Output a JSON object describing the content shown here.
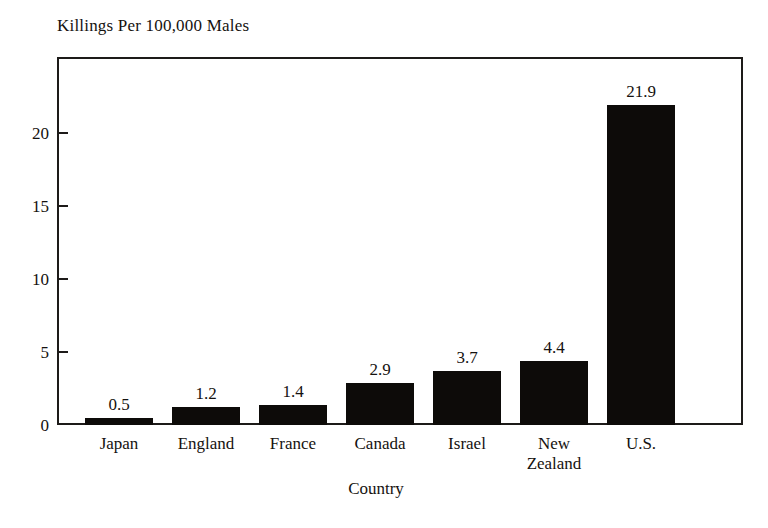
{
  "chart_data": {
    "type": "bar",
    "title": "Killings Per 100,000 Males",
    "xlabel": "Country",
    "ylabel": "",
    "categories": [
      "Japan",
      "England",
      "France",
      "Canada",
      "Israel",
      "New Zealand",
      "U.S."
    ],
    "category_lines": [
      [
        "Japan"
      ],
      [
        "England"
      ],
      [
        "France"
      ],
      [
        "Canada"
      ],
      [
        "Israel"
      ],
      [
        "New",
        "Zealand"
      ],
      [
        "U.S."
      ]
    ],
    "values": [
      0.5,
      1.2,
      1.4,
      2.9,
      3.7,
      4.4,
      21.9
    ],
    "value_labels": [
      "0.5",
      "1.2",
      "1.4",
      "2.9",
      "3.7",
      "4.4",
      "21.9"
    ],
    "ylim": [
      0,
      25
    ],
    "yticks": [
      0,
      5,
      10,
      15,
      20
    ],
    "ytick_labels": [
      "0",
      "5",
      "10",
      "15",
      "20"
    ],
    "grid": false,
    "legend": null,
    "bar_color": "#0d0b09",
    "frame_color": "#1d1b19",
    "background": "#ffffff"
  }
}
